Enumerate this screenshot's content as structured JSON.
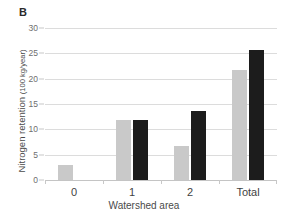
{
  "figure": {
    "panel_letter": "B"
  },
  "chart_data": {
    "type": "bar",
    "title": "",
    "panel_label": "B",
    "categories": [
      "0",
      "1",
      "2",
      "Total"
    ],
    "series": [
      {
        "name": "series-light",
        "color": "#c9c9c9",
        "values": [
          3.0,
          11.8,
          6.8,
          21.8
        ]
      },
      {
        "name": "series-dark",
        "color": "#1c1c1c",
        "values": [
          0,
          11.8,
          13.6,
          25.7
        ]
      }
    ],
    "xlabel": "Watershed area",
    "ylabel": "Nitrogen retention",
    "yunit": "(100 kg/year)",
    "ylabel_full": "Nitrogen retention (100 kg/year)",
    "ylim": [
      0,
      30
    ],
    "ytick_labels": [
      "0",
      "5",
      "10",
      "15",
      "20",
      "25",
      "30"
    ],
    "ytick_values": [
      0,
      5,
      10,
      15,
      20,
      25,
      30
    ],
    "grid": "horizontal",
    "legend": "none",
    "background_color": "#ffffff",
    "gridline_color": "#dcdcdc"
  }
}
